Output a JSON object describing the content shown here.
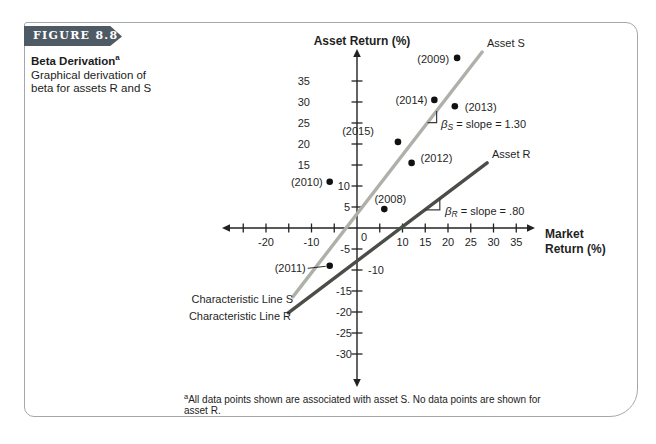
{
  "figure": {
    "tab_label": "FIGURE 8.8",
    "title": "Beta Derivation",
    "title_sup": "a",
    "subtitle_lines": [
      "Graphical derivation of",
      "beta for assets R and S"
    ],
    "footnote_sup": "a",
    "footnote_text": "All data points shown are associated with asset S. No data points are shown for asset R."
  },
  "colors": {
    "tab_bg": "#4e5a64",
    "border": "#a3a8ab",
    "line_s": "#aeb1a9",
    "line_r": "#4a4d48",
    "axis": "#222222",
    "point": "#111111"
  },
  "chart_data": {
    "type": "scatter",
    "x_axis": {
      "title_lines": [
        "Market",
        "Return (%)"
      ],
      "range": [
        -25,
        35
      ],
      "tick_step": 5,
      "labeled_ticks": [
        -20,
        -10,
        0,
        10,
        15,
        20,
        25,
        30,
        35
      ]
    },
    "y_axis": {
      "title": "Asset Return (%)",
      "range": [
        -30,
        35
      ],
      "tick_step": 5,
      "labeled_ticks": [
        35,
        30,
        25,
        20,
        15,
        10,
        5,
        -5,
        -10,
        -15,
        -20,
        -25,
        -30
      ]
    },
    "points": [
      {
        "label": "(2008)",
        "x": 6,
        "y": 4.5
      },
      {
        "label": "(2009)",
        "x": 22,
        "y": 40.5
      },
      {
        "label": "(2010)",
        "x": -6,
        "y": 11
      },
      {
        "label": "(2011)",
        "x": -6,
        "y": -9
      },
      {
        "label": "(2012)",
        "x": 12,
        "y": 15.5
      },
      {
        "label": "(2013)",
        "x": 21.5,
        "y": 29
      },
      {
        "label": "(2014)",
        "x": 17,
        "y": 30.5
      },
      {
        "label": "(2015)",
        "x": 9,
        "y": 20.5
      }
    ],
    "lines": [
      {
        "id": "S",
        "name_label": "Asset S",
        "char_label": "Characteristic Line S",
        "slope": 1.3,
        "beta": {
          "sym": "β",
          "sub": "S",
          "text": " = slope = 1.30"
        },
        "x_from": -14.1,
        "y_from": -16.4,
        "x_to": 27.5,
        "y_to": 41.9
      },
      {
        "id": "R",
        "name_label": "Asset R",
        "char_label": "Characteristic Line R",
        "slope": 0.8,
        "beta": {
          "sym": "β",
          "sub": "R",
          "text": " = slope = .80"
        },
        "x_from": -15.1,
        "y_from": -20.2,
        "x_to": 28.6,
        "y_to": 15.5
      }
    ]
  }
}
